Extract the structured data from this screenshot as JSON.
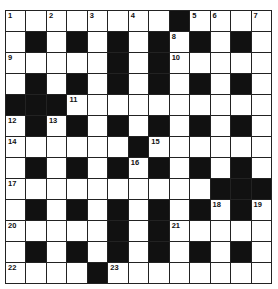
{
  "puzzle": {
    "rows": 13,
    "cols": 13,
    "colors": {
      "block": "#111111",
      "cell": "#ffffff",
      "line": "#222222"
    },
    "grid": [
      "........#....",
      ".#.#.#.#.#.#.",
      ".....#.#.....",
      ".#.#.#.#.#.#.",
      "###..........",
      ".#.#.#.#.#.#.",
      "......#......",
      ".#.#.#.#.#.#.",
      "..........###",
      ".#.#.#.#.#.#.",
      ".....#.#.....",
      ".#.#.#.#.#.#.",
      "....#........"
    ],
    "numbers": [
      {
        "n": "1",
        "r": 0,
        "c": 0
      },
      {
        "n": "2",
        "r": 0,
        "c": 2
      },
      {
        "n": "3",
        "r": 0,
        "c": 4
      },
      {
        "n": "4",
        "r": 0,
        "c": 6
      },
      {
        "n": "5",
        "r": 0,
        "c": 9
      },
      {
        "n": "6",
        "r": 0,
        "c": 10
      },
      {
        "n": "7",
        "r": 0,
        "c": 12
      },
      {
        "n": "8",
        "r": 1,
        "c": 8
      },
      {
        "n": "9",
        "r": 2,
        "c": 0
      },
      {
        "n": "10",
        "r": 2,
        "c": 8
      },
      {
        "n": "11",
        "r": 4,
        "c": 3
      },
      {
        "n": "12",
        "r": 5,
        "c": 0
      },
      {
        "n": "13",
        "r": 5,
        "c": 2
      },
      {
        "n": "14",
        "r": 6,
        "c": 0
      },
      {
        "n": "15",
        "r": 6,
        "c": 7
      },
      {
        "n": "16",
        "r": 7,
        "c": 6
      },
      {
        "n": "17",
        "r": 8,
        "c": 0
      },
      {
        "n": "18",
        "r": 9,
        "c": 10
      },
      {
        "n": "19",
        "r": 9,
        "c": 12
      },
      {
        "n": "20",
        "r": 10,
        "c": 0
      },
      {
        "n": "21",
        "r": 10,
        "c": 8
      },
      {
        "n": "22",
        "r": 12,
        "c": 0
      },
      {
        "n": "23",
        "r": 12,
        "c": 5
      }
    ]
  }
}
